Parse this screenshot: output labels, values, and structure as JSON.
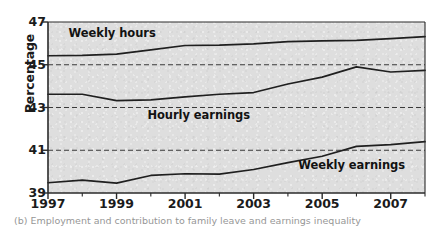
{
  "chart_data": {
    "type": "line",
    "title": "",
    "xlabel": "",
    "ylabel": "Percentage",
    "xlim": [
      1997,
      2008
    ],
    "ylim": [
      39,
      47
    ],
    "yticks": [
      39,
      41,
      43,
      45,
      47
    ],
    "xticks": [
      1997,
      1999,
      2001,
      2003,
      2005,
      2007
    ],
    "xtick_labels": [
      "1997",
      "1999",
      "2001",
      "2003",
      "2005",
      "2007"
    ],
    "ytick_labels": [
      "39",
      "41",
      "43",
      "45",
      "47"
    ],
    "grid": "horizontal-dashed",
    "gridlines": [
      41,
      43,
      45
    ],
    "legend_position": "inline-labels",
    "plot_background": "#dedede",
    "line_color": "#1f1f1f",
    "x": [
      1997,
      1998,
      1999,
      2000,
      2001,
      2002,
      2003,
      2004,
      2005,
      2006,
      2007,
      2008
    ],
    "series": [
      {
        "name": "Weekly hours",
        "label_x": 1997.6,
        "label_y": 46.45,
        "values": [
          45.42,
          45.44,
          45.5,
          45.7,
          45.9,
          45.92,
          45.98,
          46.08,
          46.12,
          46.14,
          46.22,
          46.32
        ]
      },
      {
        "name": "Hourly earnings",
        "label_x": 1999.9,
        "label_y": 42.6,
        "values": [
          43.62,
          43.62,
          43.32,
          43.36,
          43.5,
          43.62,
          43.7,
          44.1,
          44.42,
          44.9,
          44.66,
          44.74
        ]
      },
      {
        "name": "Weekly earnings",
        "label_x": 2004.3,
        "label_y": 40.25,
        "values": [
          39.48,
          39.6,
          39.46,
          39.82,
          39.9,
          39.88,
          40.1,
          40.42,
          40.72,
          41.18,
          41.26,
          41.4
        ]
      }
    ]
  },
  "caption": {
    "text": "(b) Employment and contribution to family leave and earnings inequality"
  }
}
